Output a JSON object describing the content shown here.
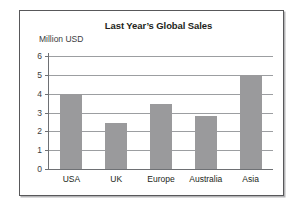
{
  "chart_data": {
    "type": "bar",
    "title": "Last Year’s Global Sales",
    "xlabel": "",
    "ylabel": "Million USD",
    "categories": [
      "USA",
      "UK",
      "Europe",
      "Australia",
      "Asia"
    ],
    "values": [
      4.0,
      2.45,
      3.45,
      2.8,
      5.0
    ],
    "ylim": [
      0,
      6
    ],
    "ytick_labels": [
      "0",
      "1",
      "2",
      "3",
      "4",
      "5",
      "6"
    ],
    "yticks": [
      0,
      1,
      2,
      3,
      4,
      5,
      6
    ],
    "grid": "horizontal",
    "legend": "none",
    "bar_color": "#9a9a9c",
    "gridline_color": "#9c9ea1",
    "axis_color": "#6e7074",
    "text_color": "#231f20",
    "background": "#ffffff",
    "frame_border_color": "#58585a"
  }
}
